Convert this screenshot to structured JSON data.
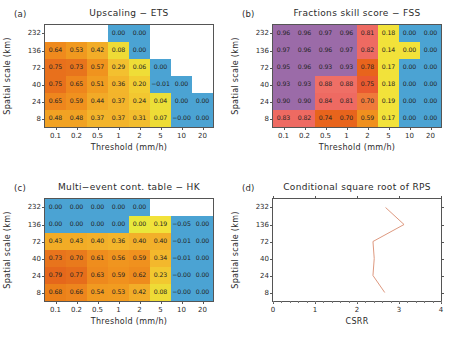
{
  "figure": {
    "panels": [
      "a",
      "b",
      "c",
      "d"
    ]
  },
  "axes": {
    "x_title": "Threshold  (mm/h)",
    "y_title": "Spatial scale (km)",
    "x_ticks": [
      "0.1",
      "0.2",
      "0.5",
      "1",
      "2",
      "5",
      "10",
      "20"
    ],
    "y_ticks": [
      "232",
      "136",
      "72",
      "40",
      "24",
      "8"
    ]
  },
  "panel_a": {
    "tag": "(a)",
    "title": "Upscaling  −  ETS"
  },
  "panel_b": {
    "tag": "(b)",
    "title": "Fractions skill score  −  FSS"
  },
  "panel_c": {
    "tag": "(c)",
    "title": "Multi−event cont. table  −  HK"
  },
  "panel_d": {
    "tag": "(d)",
    "title": "Conditional square root of RPS",
    "x_title": "CSRR",
    "y_title": "Spatial scale (km)",
    "x_ticks": [
      "0",
      "1",
      "2",
      "3",
      "4"
    ]
  },
  "colors": {
    "ets_fss_hk_blue": "#4ba3d3",
    "yellow": "#f2e23a",
    "orange": "#f0901e",
    "deep_orange": "#e8641c",
    "red": "#ea5a4a",
    "purple": "#9b6ba8",
    "line": "#d98c70",
    "axis": "#555555",
    "text": "#232323"
  },
  "chart_data": [
    {
      "type": "heatmap",
      "panel": "a",
      "title": "Upscaling  −  ETS",
      "xlabel": "Threshold  (mm/h)",
      "ylabel": "Spatial scale (km)",
      "categories_x": [
        "0.1",
        "0.2",
        "0.5",
        "1",
        "2",
        "5",
        "10",
        "20"
      ],
      "categories_y": [
        "232",
        "136",
        "72",
        "40",
        "24",
        "8"
      ],
      "rows": [
        {
          "y": "232",
          "cells": [
            {
              "v": null,
              "color": "#ffffff"
            },
            {
              "v": null,
              "color": "#ffffff"
            },
            {
              "v": null,
              "color": "#ffffff"
            },
            {
              "v": "0.00",
              "color": "#4ba3d3"
            },
            {
              "v": "0.00",
              "color": "#4ba3d3"
            },
            {
              "v": null,
              "color": "#ffffff"
            },
            {
              "v": null,
              "color": "#ffffff"
            },
            {
              "v": null,
              "color": "#ffffff"
            }
          ]
        },
        {
          "y": "136",
          "cells": [
            {
              "v": "0.64",
              "color": "#ef8a1d"
            },
            {
              "v": "0.53",
              "color": "#f0991f"
            },
            {
              "v": "0.42",
              "color": "#f2ad28"
            },
            {
              "v": "0.08",
              "color": "#eedb36"
            },
            {
              "v": "0.00",
              "color": "#4ba3d3"
            },
            {
              "v": null,
              "color": "#ffffff"
            },
            {
              "v": null,
              "color": "#ffffff"
            },
            {
              "v": null,
              "color": "#ffffff"
            }
          ]
        },
        {
          "y": "72",
          "cells": [
            {
              "v": "0.75",
              "color": "#e8701c"
            },
            {
              "v": "0.73",
              "color": "#e8741c"
            },
            {
              "v": "0.57",
              "color": "#f0931e"
            },
            {
              "v": "0.29",
              "color": "#f3c02f"
            },
            {
              "v": "0.06",
              "color": "#efdd37"
            },
            {
              "v": "0.00",
              "color": "#4ba3d3"
            },
            {
              "v": null,
              "color": "#ffffff"
            },
            {
              "v": null,
              "color": "#ffffff"
            }
          ]
        },
        {
          "y": "40",
          "cells": [
            {
              "v": "0.75",
              "color": "#e8701c"
            },
            {
              "v": "0.65",
              "color": "#ee861d"
            },
            {
              "v": "0.51",
              "color": "#f19d21"
            },
            {
              "v": "0.36",
              "color": "#f3b52b"
            },
            {
              "v": "0.20",
              "color": "#f2cd32"
            },
            {
              "v": "−0.01",
              "color": "#4ba3d3"
            },
            {
              "v": "0.00",
              "color": "#4ba3d3"
            },
            {
              "v": null,
              "color": "#ffffff"
            }
          ]
        },
        {
          "y": "24",
          "cells": [
            {
              "v": "0.65",
              "color": "#ee861d"
            },
            {
              "v": "0.59",
              "color": "#f0911e"
            },
            {
              "v": "0.44",
              "color": "#f2aa27"
            },
            {
              "v": "0.37",
              "color": "#f3b42b"
            },
            {
              "v": "0.24",
              "color": "#f2c730"
            },
            {
              "v": "0.04",
              "color": "#ebdf38"
            },
            {
              "v": "0.00",
              "color": "#4ba3d3"
            },
            {
              "v": "0.00",
              "color": "#4ba3d3"
            }
          ]
        },
        {
          "y": "8",
          "cells": [
            {
              "v": "0.48",
              "color": "#f1a223"
            },
            {
              "v": "0.48",
              "color": "#f1a223"
            },
            {
              "v": "0.37",
              "color": "#f3b42b"
            },
            {
              "v": "0.37",
              "color": "#f3b42b"
            },
            {
              "v": "0.31",
              "color": "#f3bd2e"
            },
            {
              "v": "0.07",
              "color": "#eedc36"
            },
            {
              "v": "−0.00",
              "color": "#4ba3d3"
            },
            {
              "v": "0.00",
              "color": "#4ba3d3"
            }
          ]
        }
      ]
    },
    {
      "type": "heatmap",
      "panel": "b",
      "title": "Fractions skill score  −  FSS",
      "xlabel": "Threshold  (mm/h)",
      "ylabel": "Spatial scale (km)",
      "categories_x": [
        "0.1",
        "0.2",
        "0.5",
        "1",
        "2",
        "5",
        "10",
        "20"
      ],
      "categories_y": [
        "232",
        "136",
        "72",
        "40",
        "24",
        "8"
      ],
      "rows": [
        {
          "y": "232",
          "cells": [
            {
              "v": "0.96",
              "color": "#9b6ba8"
            },
            {
              "v": "0.96",
              "color": "#9b6ba8"
            },
            {
              "v": "0.97",
              "color": "#9b6ba8"
            },
            {
              "v": "0.96",
              "color": "#9b6ba8"
            },
            {
              "v": "0.81",
              "color": "#ee6a62"
            },
            {
              "v": "0.18",
              "color": "#f2e23a"
            },
            {
              "v": "0.00",
              "color": "#4ba3d3"
            },
            {
              "v": "0.00",
              "color": "#4ba3d3"
            }
          ]
        },
        {
          "y": "136",
          "cells": [
            {
              "v": "0.97",
              "color": "#9b6ba8"
            },
            {
              "v": "0.96",
              "color": "#9b6ba8"
            },
            {
              "v": "0.96",
              "color": "#9b6ba8"
            },
            {
              "v": "0.97",
              "color": "#9b6ba8"
            },
            {
              "v": "0.82",
              "color": "#ee6a62"
            },
            {
              "v": "0.14",
              "color": "#f2e23a"
            },
            {
              "v": "0.00",
              "color": "#f2e23a"
            },
            {
              "v": "0.00",
              "color": "#4ba3d3"
            }
          ]
        },
        {
          "y": "72",
          "cells": [
            {
              "v": "0.95",
              "color": "#9b6ba8"
            },
            {
              "v": "0.96",
              "color": "#9b6ba8"
            },
            {
              "v": "0.93",
              "color": "#9b6ba8"
            },
            {
              "v": "0.93",
              "color": "#9b6ba8"
            },
            {
              "v": "0.78",
              "color": "#e8641c"
            },
            {
              "v": "0.17",
              "color": "#f2e23a"
            },
            {
              "v": "0.00",
              "color": "#4ba3d3"
            },
            {
              "v": "0.00",
              "color": "#4ba3d3"
            }
          ]
        },
        {
          "y": "40",
          "cells": [
            {
              "v": "0.93",
              "color": "#9b6ba8"
            },
            {
              "v": "0.93",
              "color": "#9b6ba8"
            },
            {
              "v": "0.88",
              "color": "#ef6f66"
            },
            {
              "v": "0.88",
              "color": "#ef6f66"
            },
            {
              "v": "0.75",
              "color": "#ea5a30"
            },
            {
              "v": "0.18",
              "color": "#f2e23a"
            },
            {
              "v": "0.00",
              "color": "#4ba3d3"
            },
            {
              "v": "0.00",
              "color": "#4ba3d3"
            }
          ]
        },
        {
          "y": "24",
          "cells": [
            {
              "v": "0.90",
              "color": "#9b6ba8"
            },
            {
              "v": "0.90",
              "color": "#9b6ba8"
            },
            {
              "v": "0.84",
              "color": "#ee6a62"
            },
            {
              "v": "0.81",
              "color": "#ee6a62"
            },
            {
              "v": "0.70",
              "color": "#ef7a3a"
            },
            {
              "v": "0.19",
              "color": "#f2e23a"
            },
            {
              "v": "0.00",
              "color": "#4ba3d3"
            },
            {
              "v": "0.00",
              "color": "#4ba3d3"
            }
          ]
        },
        {
          "y": "8",
          "cells": [
            {
              "v": "0.83",
              "color": "#ee6a62"
            },
            {
              "v": "0.82",
              "color": "#ee6a62"
            },
            {
              "v": "0.74",
              "color": "#e8641c"
            },
            {
              "v": "0.70",
              "color": "#e8641c"
            },
            {
              "v": "0.59",
              "color": "#f0901e"
            },
            {
              "v": "0.17",
              "color": "#f2e23a"
            },
            {
              "v": "0.00",
              "color": "#4ba3d3"
            },
            {
              "v": "0.00",
              "color": "#4ba3d3"
            }
          ]
        }
      ]
    },
    {
      "type": "heatmap",
      "panel": "c",
      "title": "Multi−event cont. table  −  HK",
      "xlabel": "Threshold  (mm/h)",
      "ylabel": "Spatial scale (km)",
      "categories_x": [
        "0.1",
        "0.2",
        "0.5",
        "1",
        "2",
        "5",
        "10",
        "20"
      ],
      "categories_y": [
        "232",
        "136",
        "72",
        "40",
        "24",
        "8"
      ],
      "rows": [
        {
          "y": "232",
          "cells": [
            {
              "v": "0.00",
              "color": "#4ba3d3"
            },
            {
              "v": "0.00",
              "color": "#4ba3d3"
            },
            {
              "v": "0.00",
              "color": "#4ba3d3"
            },
            {
              "v": "0.00",
              "color": "#4ba3d3"
            },
            {
              "v": "0.00",
              "color": "#4ba3d3"
            },
            {
              "v": null,
              "color": "#ffffff"
            },
            {
              "v": null,
              "color": "#ffffff"
            },
            {
              "v": null,
              "color": "#ffffff"
            }
          ]
        },
        {
          "y": "136",
          "cells": [
            {
              "v": "0.00",
              "color": "#4ba3d3"
            },
            {
              "v": "0.00",
              "color": "#4ba3d3"
            },
            {
              "v": "0.00",
              "color": "#4ba3d3"
            },
            {
              "v": "0.00",
              "color": "#4ba3d3"
            },
            {
              "v": "0.00",
              "color": "#e8e83c"
            },
            {
              "v": "0.19",
              "color": "#f2e23a"
            },
            {
              "v": "−0.05",
              "color": "#4ba3d3"
            },
            {
              "v": "0.00",
              "color": "#4ba3d3"
            }
          ]
        },
        {
          "y": "72",
          "cells": [
            {
              "v": "0.43",
              "color": "#f2ac26"
            },
            {
              "v": "0.43",
              "color": "#f2ac26"
            },
            {
              "v": "0.40",
              "color": "#f2b02a"
            },
            {
              "v": "0.36",
              "color": "#f3b52b"
            },
            {
              "v": "0.40",
              "color": "#f2b02a"
            },
            {
              "v": "0.40",
              "color": "#f2b02a"
            },
            {
              "v": "−0.01",
              "color": "#4ba3d3"
            },
            {
              "v": "0.00",
              "color": "#4ba3d3"
            }
          ]
        },
        {
          "y": "40",
          "cells": [
            {
              "v": "0.73",
              "color": "#e8741c"
            },
            {
              "v": "0.70",
              "color": "#e97a1c"
            },
            {
              "v": "0.61",
              "color": "#ef8d1d"
            },
            {
              "v": "0.56",
              "color": "#f0951f"
            },
            {
              "v": "0.59",
              "color": "#f0911e"
            },
            {
              "v": "0.34",
              "color": "#f3b82c"
            },
            {
              "v": "−0.01",
              "color": "#4ba3d3"
            },
            {
              "v": "0.00",
              "color": "#4ba3d3"
            }
          ]
        },
        {
          "y": "24",
          "cells": [
            {
              "v": "0.79",
              "color": "#e5671b"
            },
            {
              "v": "0.77",
              "color": "#e66d1b"
            },
            {
              "v": "0.63",
              "color": "#ee891d"
            },
            {
              "v": "0.59",
              "color": "#f0911e"
            },
            {
              "v": "0.62",
              "color": "#ee8b1d"
            },
            {
              "v": "0.23",
              "color": "#f2c830"
            },
            {
              "v": "−0.00",
              "color": "#4ba3d3"
            },
            {
              "v": "0.00",
              "color": "#4ba3d3"
            }
          ]
        },
        {
          "y": "8",
          "cells": [
            {
              "v": "0.68",
              "color": "#eb8019"
            },
            {
              "v": "0.66",
              "color": "#ed851d"
            },
            {
              "v": "0.54",
              "color": "#f19a20"
            },
            {
              "v": "0.53",
              "color": "#f19c20"
            },
            {
              "v": "0.42",
              "color": "#f2ad28"
            },
            {
              "v": "0.08",
              "color": "#eedb36"
            },
            {
              "v": "−0.00",
              "color": "#4ba3d3"
            },
            {
              "v": "0.00",
              "color": "#4ba3d3"
            }
          ]
        }
      ]
    },
    {
      "type": "line",
      "panel": "d",
      "title": "Conditional square root of RPS",
      "xlabel": "CSRR",
      "ylabel": "Spatial scale (km)",
      "xlim": [
        0,
        4
      ],
      "x_ticks": [
        0,
        1,
        2,
        3,
        4
      ],
      "y_categories": [
        "232",
        "136",
        "72",
        "40",
        "24",
        "8"
      ],
      "grid": false,
      "series": [
        {
          "name": "CSRR",
          "points": [
            {
              "y": "232",
              "value": 2.68
            },
            {
              "y": "136",
              "value": 3.12
            },
            {
              "y": "72",
              "value": 2.38
            },
            {
              "y": "40",
              "value": 2.41
            },
            {
              "y": "24",
              "value": 2.38
            },
            {
              "y": "8",
              "value": 2.66
            }
          ]
        }
      ]
    }
  ]
}
